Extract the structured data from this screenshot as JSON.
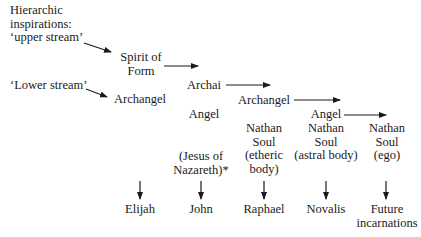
{
  "diagram": {
    "header": [
      "Hierarchic",
      "inspirations:",
      "‘upper stream’"
    ],
    "lower_stream": "‘Lower stream’",
    "nodes": {
      "spirit_of_form": [
        "Spirit of",
        "Form"
      ],
      "archangel_left": "Archangel",
      "archai": "Archai",
      "angel_left": "Angel",
      "archangel_mid": "Archangel",
      "angel_right": "Angel",
      "nathan_etheric": [
        "Nathan",
        "Soul",
        "(etheric",
        "body)"
      ],
      "nathan_astral": [
        "Nathan",
        "Soul",
        "(astral body)"
      ],
      "nathan_ego": [
        "Nathan",
        "Soul",
        "(ego)"
      ],
      "jesus": [
        "(Jesus of",
        "Nazareth)*"
      ]
    },
    "incarnations": [
      "Elijah",
      "John",
      "Raphael",
      "Novalis",
      "Future",
      "incarnations"
    ]
  }
}
